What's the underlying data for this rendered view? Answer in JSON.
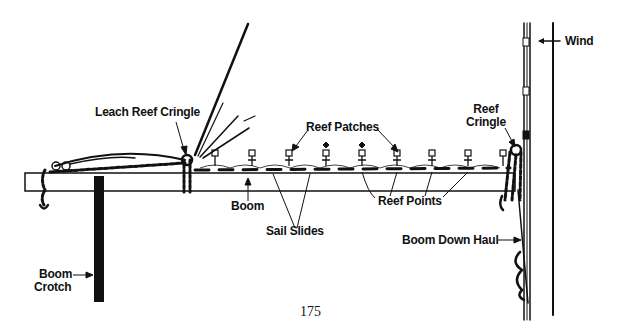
{
  "diagram": {
    "labels": {
      "leach_reef_cringle": "Leach Reef Cringle",
      "reef_patches": "Reef Patches",
      "reef_cringle_line1": "Reef",
      "reef_cringle_line2": "Cringle",
      "wind": "Wind",
      "boom": "Boom",
      "sail_slides": "Sail Slides",
      "reef_points": "Reef Points",
      "boom_down_haul": "Boom Down Haul",
      "boom_crotch_line1": "Boom",
      "boom_crotch_line2": "Crotch"
    },
    "colors": {
      "ink": "#111111",
      "background": "#ffffff"
    }
  },
  "page": {
    "number": "175"
  }
}
